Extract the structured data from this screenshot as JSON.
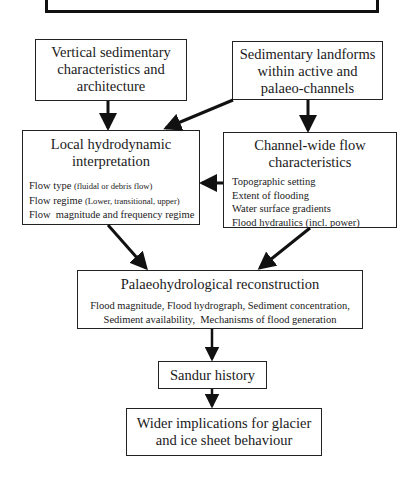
{
  "diagram": {
    "top_box": {
      "title": ""
    },
    "boxes": {
      "vertical_sedimentary": {
        "title_lines": [
          "Vertical sedimentary",
          "characteristics and",
          "architecture"
        ]
      },
      "sedimentary_landforms": {
        "title_lines": [
          "Sedimentary landforms",
          "within active and",
          "palaeo-channels"
        ]
      },
      "local_hydrodynamic": {
        "title_lines": [
          "Local hydrodynamic",
          "interpretation"
        ],
        "details": [
          {
            "main": "Flow type ",
            "paren": "(fluidal or debris flow)"
          },
          {
            "main": "Flow regime ",
            "paren": "(Lower, transitional, upper)"
          },
          {
            "main": "Flow  magnitude and frequency regime",
            "paren": ""
          }
        ]
      },
      "channel_wide": {
        "title_lines": [
          "Channel-wide flow",
          "characteristics"
        ],
        "details": [
          "Topographic setting",
          "Extent of flooding",
          "Water surface gradients",
          "Flood hydraulics (incl. power)"
        ]
      },
      "palaeohydrological": {
        "title_lines": [
          "Palaeohydrological reconstruction"
        ],
        "details": [
          "Flood magnitude, Flood hydrograph, Sediment concentration,",
          "Sediment availability,  Mechanisms of flood generation"
        ]
      },
      "sandur_history": {
        "title_lines": [
          "Sandur history"
        ]
      },
      "wider_implications": {
        "title_lines": [
          "Wider implications for glacier",
          "and ice sheet behaviour"
        ]
      }
    },
    "edges": [
      {
        "from": "vertical_sedimentary",
        "to": "local_hydrodynamic"
      },
      {
        "from": "sedimentary_landforms",
        "to": "local_hydrodynamic"
      },
      {
        "from": "sedimentary_landforms",
        "to": "channel_wide"
      },
      {
        "from": "channel_wide",
        "to": "local_hydrodynamic"
      },
      {
        "from": "local_hydrodynamic",
        "to": "palaeohydrological"
      },
      {
        "from": "channel_wide",
        "to": "palaeohydrological"
      },
      {
        "from": "palaeohydrological",
        "to": "sandur_history"
      },
      {
        "from": "sandur_history",
        "to": "wider_implications"
      }
    ],
    "colors": {
      "line": "#111111",
      "box_border": "#222222",
      "background": "#ffffff"
    }
  }
}
